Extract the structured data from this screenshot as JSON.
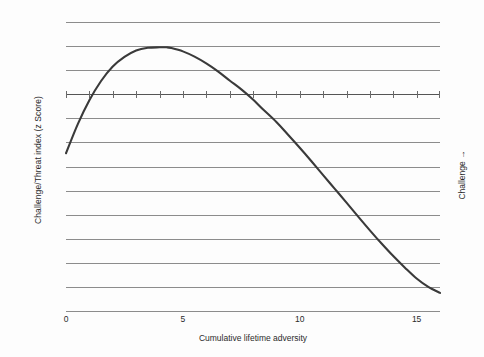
{
  "chart_data": {
    "type": "line",
    "title": "",
    "xlabel": "Cumulative lifetime adversity",
    "ylabel": "Challenge/Threat index (z Score)",
    "right_label": "Challenge  →",
    "xlim": [
      0,
      16
    ],
    "ylim": [
      -0.9,
      0.3
    ],
    "grid": true,
    "legend": "none",
    "y_ticks": [
      "0.3",
      "0.2",
      "0.1",
      "0.0",
      "–0.1",
      "–0.2",
      "–0.3",
      "–0.4",
      "–0.5",
      "–0.6",
      "–0.7",
      "–0.8",
      "–0.9"
    ],
    "y_tick_values": [
      0.3,
      0.2,
      0.1,
      0.0,
      -0.1,
      -0.2,
      -0.3,
      -0.4,
      -0.5,
      -0.6,
      -0.7,
      -0.8,
      -0.9
    ],
    "x_ticks": [
      "0",
      "5",
      "10",
      "15"
    ],
    "x_tick_values": [
      0,
      5,
      10,
      15
    ],
    "zero_line_tick_values": [
      0,
      1,
      2,
      3,
      4,
      5,
      6,
      7,
      8,
      9,
      10,
      11,
      12,
      13,
      14,
      15,
      16
    ],
    "series": [
      {
        "name": "Challenge/Threat index",
        "x": [
          0,
          0.5,
          1,
          1.5,
          2,
          2.5,
          3,
          3.5,
          4,
          4.3,
          4.5,
          5,
          5.5,
          6,
          6.5,
          7,
          7.5,
          8,
          8.4,
          9,
          9.5,
          10,
          10.5,
          11,
          11.5,
          12,
          12.5,
          13,
          13.5,
          14,
          14.5,
          15,
          15.5,
          16
        ],
        "y": [
          -0.245,
          -0.125,
          -0.025,
          0.055,
          0.115,
          0.155,
          0.182,
          0.193,
          0.195,
          0.195,
          0.192,
          0.178,
          0.156,
          0.128,
          0.095,
          0.057,
          0.02,
          -0.022,
          -0.06,
          -0.115,
          -0.168,
          -0.222,
          -0.278,
          -0.336,
          -0.393,
          -0.45,
          -0.508,
          -0.565,
          -0.62,
          -0.672,
          -0.72,
          -0.765,
          -0.8,
          -0.825
        ]
      }
    ],
    "annotations": {
      "peak_x": 4.3,
      "peak_y": 0.195,
      "zero_crossings": [
        1.1,
        8.4
      ],
      "start_point": [
        0,
        -0.245
      ],
      "end_point": [
        16,
        -0.825
      ]
    },
    "colors": {
      "curve": "#3a3a3a",
      "grid": "#8c8c8c",
      "zero_axis": "#555555",
      "text": "#2b2b2b",
      "background": "#fdfdfd"
    }
  }
}
